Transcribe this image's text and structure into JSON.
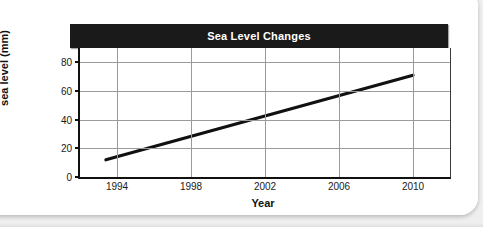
{
  "figure": {
    "title": "Sea Level Changes",
    "title_bar_color": "#1a1a1a",
    "title_text_color": "#ffffff",
    "line_color": "#111111",
    "gridline_color": "#9a9a9a",
    "background_color": "#ffffff"
  },
  "chart_data": {
    "type": "line",
    "title": "Sea Level Changes",
    "xlabel": "Year",
    "ylabel": "Change in mean sea level (mm)",
    "ylabel_line1": "Change in mean",
    "ylabel_line2": "sea level (mm)",
    "xlim": [
      1992,
      2012
    ],
    "ylim": [
      0,
      90
    ],
    "xticks": [
      1994,
      1998,
      2002,
      2006,
      2010
    ],
    "xtick_labels": [
      "1994",
      "1998",
      "2002",
      "2006",
      "2010"
    ],
    "yticks": [
      0,
      20,
      40,
      60,
      80
    ],
    "ytick_labels": [
      "0",
      "20",
      "40",
      "60",
      "80"
    ],
    "grid": true,
    "legend": null,
    "series": [
      {
        "name": "Change in mean sea level",
        "x": [
          1993.4,
          2010.0
        ],
        "values": [
          12,
          71
        ]
      }
    ]
  }
}
